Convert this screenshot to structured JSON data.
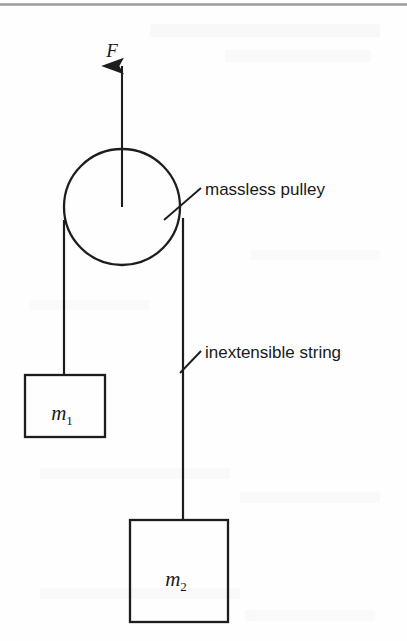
{
  "page": {
    "width": 407,
    "height": 641,
    "background_color": "#fefefe",
    "ink_color": "#1d1d1d",
    "rule_color": "#9a9a9a"
  },
  "top_rule": {
    "name": "horizontal-rule",
    "y": 4,
    "x1": 0,
    "x2": 407
  },
  "diagram": {
    "force_arrow": {
      "label": "F",
      "label_x": 112,
      "label_y": 56,
      "x": 122,
      "tip_y": 64,
      "tail_y": 207,
      "direction": "up"
    },
    "pulley": {
      "cx": 122,
      "cy": 207,
      "r": 58,
      "label": "massless pulley",
      "label_x": 203,
      "label_y": 190,
      "leader": {
        "x1": 165,
        "y1": 219,
        "x2": 200,
        "y2": 189
      }
    },
    "string": {
      "label": "inextensible string",
      "label_x": 203,
      "label_y": 357,
      "leader": {
        "x1": 181,
        "y1": 372,
        "x2": 200,
        "y2": 352
      },
      "left_segment": {
        "x": 64,
        "y1": 222,
        "y2": 375
      },
      "right_segment": {
        "x": 183,
        "y1": 219,
        "y2": 520
      }
    },
    "blocks": [
      {
        "name": "block-m1",
        "label": "m",
        "subscript": "1",
        "x": 25,
        "y": 375,
        "width": 80,
        "height": 62,
        "label_cx": 65,
        "label_cy": 414
      },
      {
        "name": "block-m2",
        "label": "m",
        "subscript": "2",
        "x": 130,
        "y": 520,
        "width": 98,
        "height": 102,
        "label_cx": 179,
        "label_cy": 580
      }
    ]
  },
  "bleed_through": {
    "note": "faint reversed show-through text from page verso",
    "lines": [
      {
        "text": "▬▬▬ ▬▬▬▬ ▬▬ ▬▬▬▬▬",
        "x": 180,
        "y": 34,
        "size": 15
      },
      {
        "text": "▬▬▬▬ ▬▬▬▬▬",
        "x": 236,
        "y": 58,
        "size": 14
      },
      {
        "text": "▬▬ ▬▬▬▬▬ ▬▬▬",
        "x": 70,
        "y": 478,
        "size": 13
      },
      {
        "text": "▬▬▬ ▬▬▬ ▬▬▬▬",
        "x": 250,
        "y": 500,
        "size": 13
      },
      {
        "text": "▬▬▬▬ ▬▬ ▬▬▬▬▬",
        "x": 60,
        "y": 596,
        "size": 13
      },
      {
        "text": "▬▬▬ ▬▬▬▬▬",
        "x": 252,
        "y": 618,
        "size": 13
      }
    ]
  }
}
